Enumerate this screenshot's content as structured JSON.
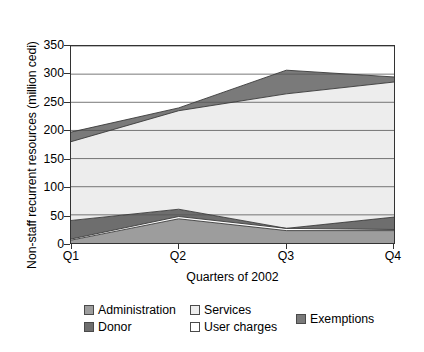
{
  "chart_data": {
    "type": "area",
    "stacked": true,
    "title": "",
    "xlabel": "Quarters of 2002",
    "ylabel": "Non-staff recurrent resources (million cedi)",
    "categories": [
      "Q1",
      "Q2",
      "Q3",
      "Q4"
    ],
    "ylim": [
      0,
      350
    ],
    "yticks": [
      0,
      50,
      100,
      150,
      200,
      250,
      300,
      350
    ],
    "ytick_labels": [
      "0",
      "50",
      "100",
      "150",
      "200",
      "250",
      "300",
      "350"
    ],
    "grid": "horizontal",
    "legend_position": "bottom",
    "series": [
      {
        "name": "Administration",
        "color": "#9d9d9d",
        "values": [
          5,
          43,
          22,
          22
        ]
      },
      {
        "name": "User charges",
        "color": "#ffffff",
        "values": [
          2,
          4,
          4,
          2
        ]
      },
      {
        "name": "Donor",
        "color": "#6e6e6e",
        "values": [
          33,
          13,
          0,
          22
        ]
      },
      {
        "name": "Services",
        "color": "#ededed",
        "values": [
          140,
          175,
          239,
          240
        ]
      },
      {
        "name": "Exemptions",
        "color": "#7a7a7a",
        "values": [
          17,
          5,
          42,
          9
        ]
      }
    ],
    "stack_totals": [
      197,
      240,
      307,
      295
    ],
    "legend_order": [
      "Administration",
      "Services",
      "Donor",
      "User charges",
      "Exemptions"
    ],
    "axis_color": "#333333",
    "grid_color": "#555555"
  },
  "axes": {
    "y_title": "Non-staff recurrent resources (million cedi)",
    "x_title": "Quarters of 2002",
    "y_labels": [
      "350",
      "300",
      "250",
      "200",
      "150",
      "100",
      "50",
      "0"
    ],
    "x_labels": [
      "Q1",
      "Q2",
      "Q3",
      "Q4"
    ]
  },
  "legend": {
    "administration": "Administration",
    "services": "Services",
    "donor": "Donor",
    "user_charges": "User charges",
    "exemptions": "Exemptions"
  }
}
